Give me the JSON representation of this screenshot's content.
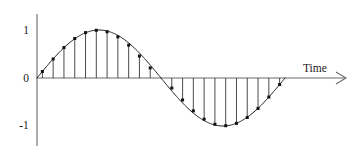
{
  "figure": {
    "background_color": "#ffffff"
  },
  "labels": {
    "y_top": "1",
    "y_zero": "0",
    "y_bottom": "-1",
    "x_axis_name": "Time"
  },
  "colors": {
    "curve": "#1f1f1f",
    "axis": "#6b6b6b",
    "stem": "#2a2a2a",
    "marker": "#111111",
    "text": "#1a1a1a"
  },
  "chart_data": {
    "type": "line",
    "title": "",
    "subtitle": "",
    "xlabel": "Time",
    "ylabel": "",
    "xlim": [
      0,
      1
    ],
    "ylim": [
      -1,
      1
    ],
    "grid": false,
    "legend": "none",
    "annotations": [
      "Vertical stems drawn from the time axis to each sample point",
      "Square markers denote sampled values on the continuous sine curve"
    ],
    "ytick_labels": [
      "1",
      "0",
      "-1"
    ],
    "ytick_values": [
      1,
      0,
      -1
    ],
    "xtick_labels": [],
    "series": [
      {
        "name": "sin(2πt)",
        "kind": "continuous-curve",
        "description": "One full period of a sine wave starting at zero, rising to +1, returning through zero, falling to -1, and ending at zero",
        "periods": 1,
        "amplitude": 1,
        "phase": 0
      },
      {
        "name": "samples",
        "kind": "stem",
        "description": "Uniformly spaced samples of the sine wave, 11 per half cycle",
        "x": [
          0.0217,
          0.0652,
          0.1087,
          0.1522,
          0.1957,
          0.2391,
          0.2826,
          0.3261,
          0.3696,
          0.413,
          0.4565,
          0.5435,
          0.587,
          0.6304,
          0.6739,
          0.7174,
          0.7609,
          0.8043,
          0.8478,
          0.8913,
          0.9348,
          0.9783
        ],
        "values": [
          0.1362,
          0.3971,
          0.6344,
          0.823,
          0.9456,
          0.9942,
          0.9638,
          0.8577,
          0.6845,
          0.4582,
          0.2108,
          -0.2108,
          -0.4582,
          -0.6845,
          -0.8577,
          -0.9638,
          -0.9942,
          -0.9456,
          -0.823,
          -0.6344,
          -0.3971,
          -0.1362
        ]
      }
    ]
  }
}
